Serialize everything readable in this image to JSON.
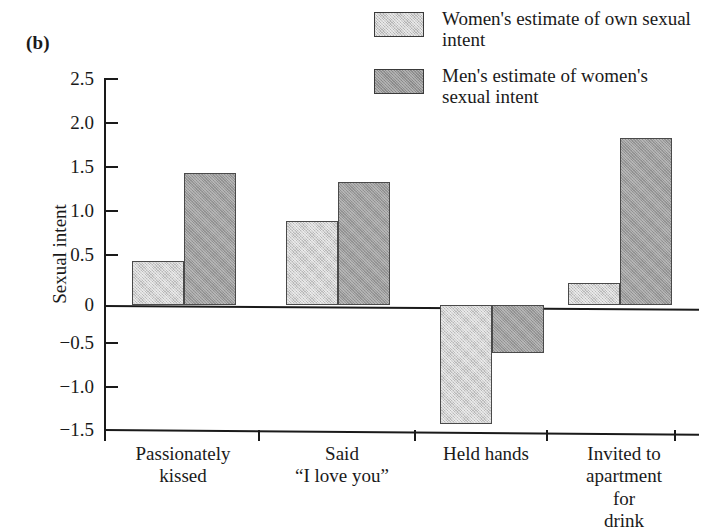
{
  "panel": {
    "label": "(b)"
  },
  "legend": {
    "position": "top-right",
    "items": [
      {
        "label": "Women's estimate of own sexual intent",
        "swatch": "light-gray-swatch",
        "color": "#b4b4b4"
      },
      {
        "label": "Men's estimate of women's sexual intent",
        "swatch": "dark-gray-swatch",
        "color": "#949494"
      }
    ]
  },
  "axes": {
    "ylabel": "Sexual intent",
    "xlabel": "",
    "yticks": [
      "2.5",
      "2.0",
      "1.5",
      "1.0",
      "0.5",
      "0",
      "−0.5",
      "−1.0",
      "−1.5"
    ],
    "ytick_values": [
      2.5,
      2.0,
      1.5,
      1.0,
      0.5,
      0,
      -0.5,
      -1.0,
      -1.5
    ],
    "ylim": [
      -1.5,
      2.5
    ],
    "grid": false
  },
  "chart_data": {
    "type": "bar",
    "title": "",
    "subtitle": "",
    "xlabel": "",
    "ylabel": "Sexual intent",
    "ylim": [
      -1.5,
      2.5
    ],
    "grid": false,
    "legend_position": "top-right",
    "categories": [
      "Passionately kissed",
      "Said “I love you”",
      "Held hands",
      "Invited to apartment for drink"
    ],
    "category_lines": [
      [
        "Passionately",
        "kissed"
      ],
      [
        "Said",
        "“I love you”"
      ],
      [
        "Held hands"
      ],
      [
        "Invited to",
        "apartment for",
        "drink"
      ]
    ],
    "series": [
      {
        "name": "Women's estimate of own sexual intent",
        "color": "#b4b4b4",
        "values": [
          0.5,
          0.95,
          -1.35,
          0.25
        ]
      },
      {
        "name": "Men's estimate of women's sexual intent",
        "color": "#949494",
        "values": [
          1.5,
          1.4,
          -0.55,
          1.9
        ]
      }
    ]
  }
}
